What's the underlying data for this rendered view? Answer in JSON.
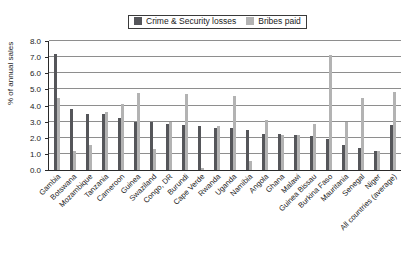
{
  "chart_data": {
    "type": "bar",
    "title": "",
    "xlabel": "",
    "ylabel": "% of annual sales",
    "ylim": [
      0,
      8
    ],
    "yticks": [
      0.0,
      1.0,
      2.0,
      3.0,
      4.0,
      5.0,
      6.0,
      7.0,
      8.0
    ],
    "ytick_labels": [
      "0.0",
      "1.0",
      "2.0",
      "3.0",
      "4.0",
      "5.0",
      "6.0",
      "7.0",
      "8.0"
    ],
    "grid": true,
    "legend_position": "top-center",
    "categories": [
      "Gambia",
      "Botswana",
      "Mozambique",
      "Tanzania",
      "Cameroon",
      "Guinea",
      "Swaziland",
      "Congo, DR",
      "Burundi",
      "Cape Verde",
      "Rwanda",
      "Uganda",
      "Namibia",
      "Angola",
      "Ghana",
      "Malawi",
      "Guinea Bissau",
      "Burkina Faso",
      "Mauritania",
      "Senegal",
      "Niger",
      "All countries (average)"
    ],
    "series": [
      {
        "name": "Crime & Security losses",
        "color": "#55565a",
        "values": [
          7.2,
          3.8,
          3.5,
          3.5,
          3.2,
          3.0,
          3.0,
          2.85,
          2.8,
          2.7,
          2.6,
          2.6,
          2.5,
          2.25,
          2.25,
          2.2,
          2.1,
          1.9,
          1.55,
          1.35,
          1.2,
          2.8
        ]
      },
      {
        "name": "Bribes paid",
        "color": "#b3b3b3",
        "values": [
          4.45,
          1.2,
          1.55,
          3.6,
          4.1,
          4.8,
          1.3,
          3.0,
          4.7,
          0.15,
          2.75,
          4.6,
          0.55,
          3.1,
          2.15,
          2.2,
          2.85,
          7.15,
          3.0,
          4.45,
          1.2,
          4.85
        ]
      }
    ]
  },
  "legend": {
    "entries": [
      {
        "label": "Crime & Security losses",
        "color": "#55565a",
        "swatch_name": "legend-swatch-dark"
      },
      {
        "label": "Bribes paid",
        "color": "#b3b3b3",
        "swatch_name": "legend-swatch-light"
      }
    ]
  }
}
